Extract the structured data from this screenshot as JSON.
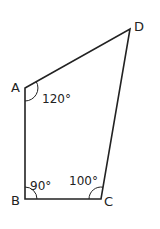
{
  "diagram": {
    "type": "quadrilateral",
    "vertices": [
      {
        "name": "A",
        "x": 25,
        "y": 88
      },
      {
        "name": "B",
        "x": 25,
        "y": 199
      },
      {
        "name": "C",
        "x": 101,
        "y": 199
      },
      {
        "name": "D",
        "x": 130,
        "y": 29
      }
    ],
    "labels": {
      "A": "A",
      "B": "B",
      "C": "C",
      "D": "D"
    },
    "angles": {
      "A": "120°",
      "B": "90°",
      "C": "100°"
    },
    "colors": {
      "stroke": "#222222",
      "background": "#ffffff"
    }
  }
}
